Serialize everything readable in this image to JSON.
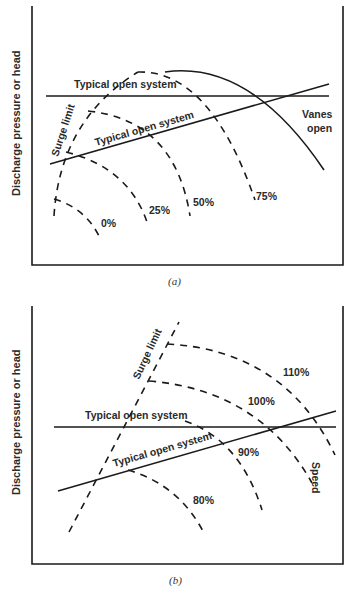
{
  "diagram_a": {
    "caption": "(a)",
    "ylabel": "Discharge pressure or head",
    "labels": {
      "system_horizontal": "Typical open system",
      "system_sloped": "Typical open system",
      "surge": "Surge limit",
      "vanes": [
        "Vanes",
        "open"
      ],
      "curves": [
        "0%",
        "25%",
        "50%",
        "75%"
      ]
    }
  },
  "diagram_b": {
    "caption": "(b)",
    "ylabel": "Discharge pressure or head",
    "labels": {
      "system_horizontal": "Typical open system",
      "system_sloped": "Typical open system",
      "surge": "Surge limit",
      "speed": "Speed",
      "curves": [
        "80%",
        "90%",
        "100%",
        "110%"
      ]
    }
  }
}
